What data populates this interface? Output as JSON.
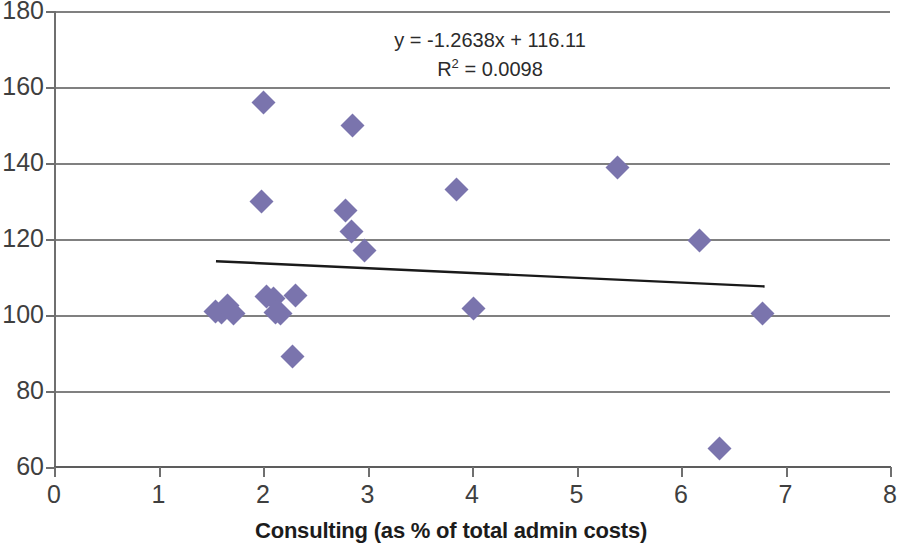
{
  "chart_data": {
    "type": "scatter",
    "title": "",
    "xlabel": "Consulting (as % of total admin costs)",
    "ylabel": "",
    "xlim": [
      0,
      8
    ],
    "ylim": [
      60,
      180
    ],
    "xticks": [
      "0",
      "1",
      "2",
      "3",
      "4",
      "5",
      "6",
      "7",
      "8"
    ],
    "yticks": [
      "60",
      "80",
      "100",
      "120",
      "140",
      "160",
      "180"
    ],
    "grid": "horizontal",
    "legend": "none",
    "marker_color": "#7a74ad",
    "marker_shape": "diamond",
    "points": [
      {
        "x": 1.55,
        "y": 101.0
      },
      {
        "x": 1.6,
        "y": 100.6
      },
      {
        "x": 1.66,
        "y": 102.6
      },
      {
        "x": 1.72,
        "y": 100.3
      },
      {
        "x": 1.99,
        "y": 129.9
      },
      {
        "x": 2.0,
        "y": 156.0
      },
      {
        "x": 2.03,
        "y": 104.8
      },
      {
        "x": 2.1,
        "y": 104.4
      },
      {
        "x": 2.12,
        "y": 100.6
      },
      {
        "x": 2.17,
        "y": 100.3
      },
      {
        "x": 2.28,
        "y": 89.2
      },
      {
        "x": 2.31,
        "y": 105.2
      },
      {
        "x": 2.79,
        "y": 127.6
      },
      {
        "x": 2.85,
        "y": 122.1
      },
      {
        "x": 2.86,
        "y": 150.0
      },
      {
        "x": 2.97,
        "y": 116.9
      },
      {
        "x": 3.85,
        "y": 133.0
      },
      {
        "x": 4.01,
        "y": 101.7
      },
      {
        "x": 5.39,
        "y": 138.8
      },
      {
        "x": 6.18,
        "y": 119.5
      },
      {
        "x": 6.37,
        "y": 65.0
      },
      {
        "x": 6.78,
        "y": 100.3
      }
    ],
    "trendline": {
      "equation": "y = -1.2638x + 116.11",
      "r_squared_label": "R",
      "r_squared_exponent": "2",
      "r_squared_value": "= 0.0098",
      "slope": -1.2638,
      "intercept": 116.11,
      "x_start": 1.55,
      "x_end": 6.8,
      "color": "#1a1a1a"
    },
    "annotations": [
      "y = -1.2638x + 116.11",
      "R2 = 0.0098"
    ]
  }
}
